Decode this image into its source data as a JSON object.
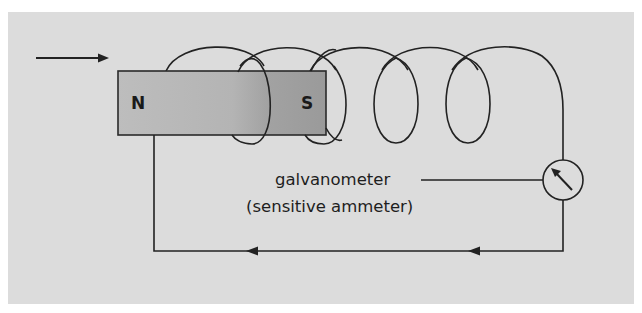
{
  "diagram": {
    "colors": {
      "page_background": "#ffffff",
      "panel_background": "#dcdcdc",
      "wire": "#222222",
      "magnet_north_shade": "#bdbdbd",
      "magnet_south_shade": "#9c9c9c",
      "magnet_border": "#2a2a2a",
      "text": "#1e1e1e"
    },
    "motion_arrow": {
      "direction": "right",
      "meaning": "magnet moving into coil",
      "x1": 36,
      "y": 58,
      "x2": 108
    },
    "magnet": {
      "x": 118,
      "y": 71,
      "width": 208,
      "height": 64,
      "north_label": "N",
      "south_label": "S"
    },
    "coil": {
      "turns": 5,
      "top_y": 52,
      "bottom_y": 143
    },
    "galvanometer": {
      "cx": 563,
      "cy": 180,
      "r": 20,
      "label_line1": "galvanometer",
      "label_line2": "(sensitive ammeter)",
      "icon": "needle-meter-icon"
    },
    "circuit": {
      "left_wire_x": 154,
      "right_wire_x": 563,
      "bottom_wire_y": 251,
      "current_arrows": [
        {
          "x": 474,
          "direction": "left"
        },
        {
          "x": 252,
          "direction": "left"
        }
      ]
    }
  }
}
